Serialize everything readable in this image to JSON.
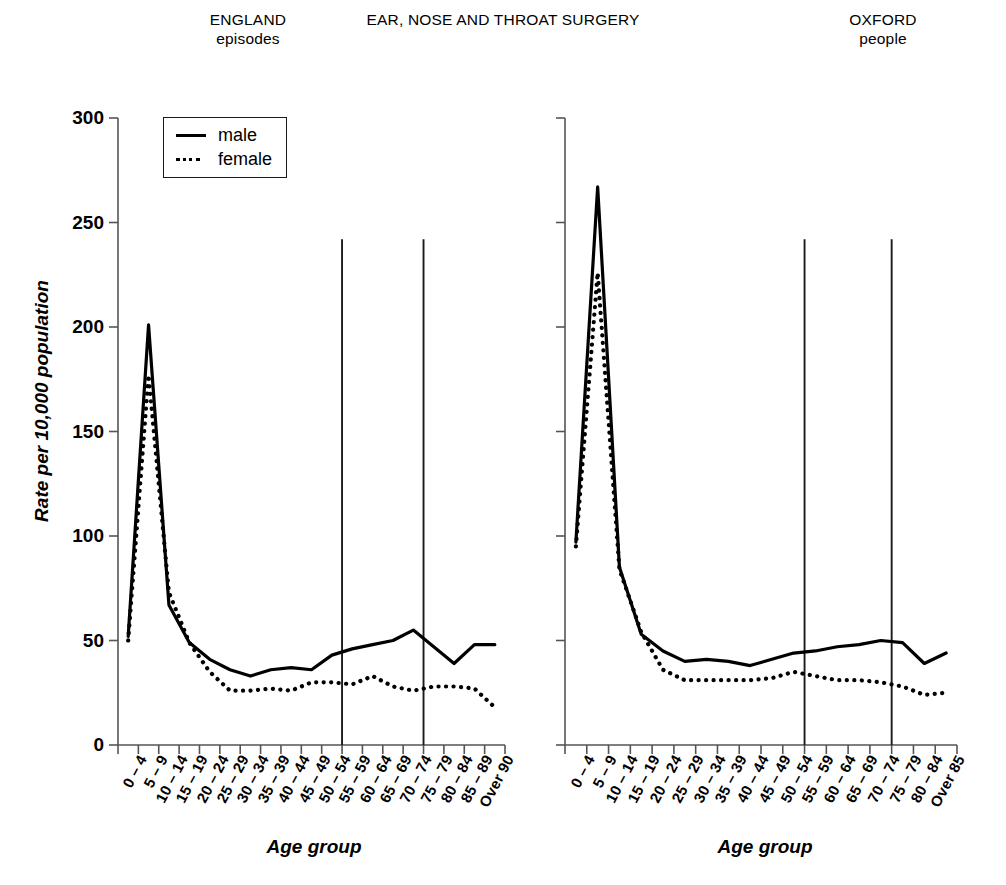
{
  "header": {
    "left_title": "ENGLAND",
    "left_subtitle": "episodes",
    "center_title": "EAR, NOSE AND THROAT SURGERY",
    "right_title": "OXFORD",
    "right_subtitle": "people"
  },
  "legend": {
    "position": "inside-top-left",
    "items": [
      {
        "label": "male",
        "style": "solid",
        "key": "line-solid-icon"
      },
      {
        "label": "female",
        "style": "dotted",
        "key": "line-dotted-icon"
      }
    ]
  },
  "axes": {
    "ylabel": "Rate per 10,000 population",
    "xlabel": "Age group",
    "yticks": [
      0,
      50,
      100,
      150,
      200,
      250,
      300
    ],
    "ymin": 0,
    "ymax": 300,
    "grid": false
  },
  "chart_data": [
    {
      "id": "england-episodes",
      "type": "line",
      "title": "ENGLAND episodes",
      "subtitle": "episodes",
      "xlabel": "Age group",
      "ylabel": "Rate per 10,000 population",
      "ylim": [
        0,
        300
      ],
      "grid": false,
      "legend_position": "top-left",
      "annotations": [
        {
          "type": "vline",
          "at_category": "55 – 59",
          "value_top": 242,
          "note": "boundary marker"
        },
        {
          "type": "vline",
          "at_category": "75 – 79",
          "value_top": 242,
          "note": "boundary marker"
        }
      ],
      "categories": [
        "0 – 4",
        "5 – 9",
        "10 – 14",
        "15 – 19",
        "20 – 24",
        "25 – 29",
        "30 – 34",
        "35 – 39",
        "40 – 44",
        "45 – 49",
        "50 – 54",
        "55 – 59",
        "60 – 64",
        "65 – 69",
        "70 – 74",
        "75 – 79",
        "80 – 84",
        "85 – 89",
        "Over 90"
      ],
      "series": [
        {
          "name": "male",
          "style": "solid",
          "values": [
            52,
            201,
            67,
            49,
            41,
            36,
            33,
            36,
            37,
            36,
            43,
            46,
            48,
            50,
            55,
            47,
            39,
            48,
            48
          ]
        },
        {
          "name": "female",
          "style": "dotted",
          "values": [
            50,
            177,
            73,
            49,
            35,
            26,
            26,
            27,
            26,
            30,
            30,
            29,
            33,
            28,
            26,
            28,
            28,
            27,
            18
          ]
        }
      ]
    },
    {
      "id": "oxford-people",
      "type": "line",
      "title": "OXFORD people",
      "subtitle": "people",
      "xlabel": "Age group",
      "ylabel": "Rate per 10,000 population",
      "ylim": [
        0,
        300
      ],
      "grid": false,
      "legend_position": "none",
      "annotations": [
        {
          "type": "vline",
          "at_category": "55 – 59",
          "value_top": 242,
          "note": "boundary marker"
        },
        {
          "type": "vline",
          "at_category": "75 – 79",
          "value_top": 242,
          "note": "boundary marker"
        }
      ],
      "categories": [
        "0 – 4",
        "5 – 9",
        "10 – 14",
        "15 – 19",
        "20 – 24",
        "25 – 29",
        "30 – 34",
        "35 – 39",
        "40 – 44",
        "45 – 49",
        "50 – 54",
        "55 – 59",
        "60 – 64",
        "65 – 69",
        "70 – 74",
        "75 – 79",
        "80 – 84",
        "Over 85"
      ],
      "series": [
        {
          "name": "male",
          "style": "solid",
          "values": [
            97,
            267,
            85,
            53,
            45,
            40,
            41,
            40,
            38,
            41,
            44,
            45,
            47,
            48,
            50,
            49,
            39,
            44
          ]
        },
        {
          "name": "female",
          "style": "dotted",
          "values": [
            95,
            226,
            84,
            54,
            36,
            31,
            31,
            31,
            31,
            32,
            35,
            33,
            31,
            31,
            30,
            28,
            24,
            25
          ]
        }
      ]
    }
  ]
}
